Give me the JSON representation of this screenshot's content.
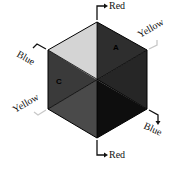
{
  "diagram": {
    "type": "hexagon-cube-faces",
    "geometry": {
      "center": [
        97,
        80
      ],
      "vertices": {
        "top": [
          97,
          22
        ],
        "upper_right": [
          147,
          50
        ],
        "lower_right": [
          147,
          109
        ],
        "bottom": [
          97,
          138
        ],
        "lower_left": [
          48,
          109
        ],
        "upper_left": [
          48,
          50
        ]
      }
    },
    "sectors": [
      {
        "id": "top-left",
        "fill": "#d4d4d4",
        "label": ""
      },
      {
        "id": "top-right",
        "fill": "#2e2e2e",
        "label": "A"
      },
      {
        "id": "right",
        "fill": "#262626",
        "label": ""
      },
      {
        "id": "bottom-right",
        "fill": "#0e0e0e",
        "label": ""
      },
      {
        "id": "bottom-left",
        "fill": "#4a4a4a",
        "label": ""
      },
      {
        "id": "left",
        "fill": "#3a3a3a",
        "label": "C"
      }
    ],
    "edge_labels": [
      {
        "id": "top",
        "text": "Red"
      },
      {
        "id": "upper-right",
        "text": "Yellow"
      },
      {
        "id": "upper-left",
        "text": "Blue"
      },
      {
        "id": "lower-left",
        "text": "Yellow"
      },
      {
        "id": "lower-right",
        "text": "Blue"
      },
      {
        "id": "bottom",
        "text": "Red"
      }
    ]
  }
}
